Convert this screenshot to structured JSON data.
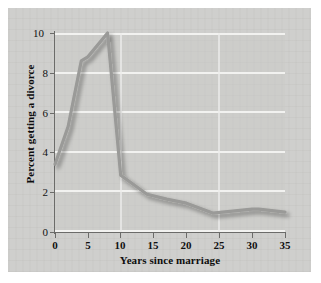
{
  "chart_data": {
    "type": "line",
    "title": "",
    "xlabel": "Years since marriage",
    "ylabel": "Percent getting a divorce",
    "xlim": [
      0,
      35
    ],
    "ylim": [
      0,
      10
    ],
    "grid": true,
    "legend": false,
    "xticks": [
      0,
      5,
      10,
      15,
      20,
      25,
      30,
      35
    ],
    "yticks": [
      0,
      2,
      4,
      6,
      8,
      10
    ],
    "series": [
      {
        "name": "Percent getting a divorce",
        "color": "#9a9a98",
        "x": [
          0,
          2,
          4,
          5,
          8,
          10,
          14,
          17,
          20,
          24,
          27,
          30,
          31,
          35
        ],
        "values": [
          3.4,
          5.3,
          8.6,
          8.8,
          10.0,
          2.85,
          1.9,
          1.65,
          1.45,
          0.95,
          1.05,
          1.15,
          1.15,
          1.0
        ]
      }
    ]
  },
  "axes": {
    "x_tick_labels": [
      "0",
      "5",
      "10",
      "15",
      "20",
      "25",
      "30",
      "35"
    ],
    "y_tick_labels": [
      "0",
      "2",
      "4",
      "6",
      "8",
      "10"
    ],
    "x_axis_title": "Years since marriage",
    "y_axis_title": "Percent getting a divorce"
  },
  "style": {
    "page_background": "#ffffff",
    "panel_background": "#cfcfcd",
    "plot_background": "#cac9c7",
    "gridline_color": "#f2f2f0",
    "axis_color": "#6b6b69",
    "line_color": "#9a9a98",
    "text_color": "#111111"
  }
}
